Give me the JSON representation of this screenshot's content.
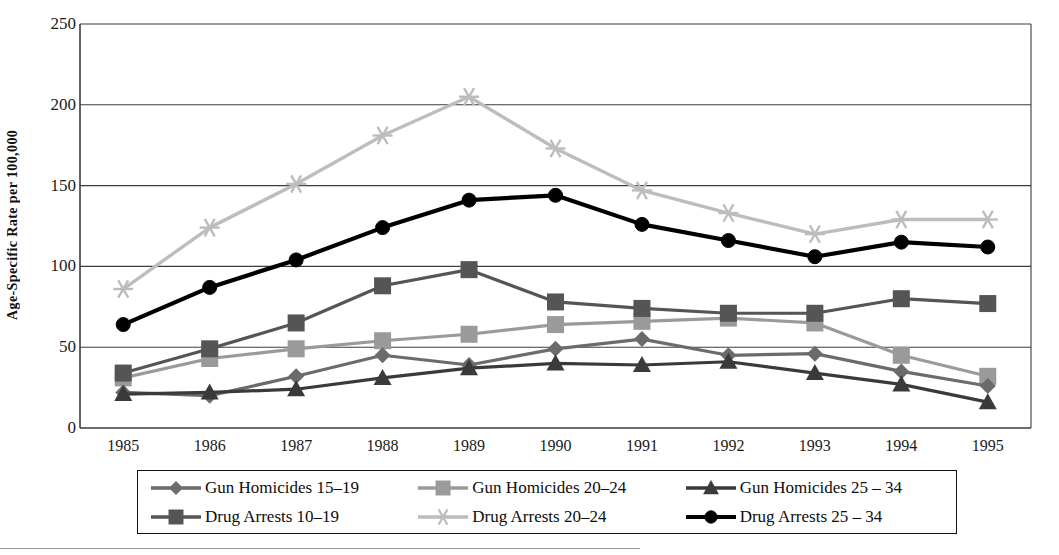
{
  "chart_data": {
    "type": "line",
    "title": "",
    "xlabel": "",
    "ylabel": "Age-Specific Rate per 100,000",
    "x": [
      "1985",
      "1986",
      "1987",
      "1988",
      "1989",
      "1990",
      "1991",
      "1992",
      "1993",
      "1994",
      "1995"
    ],
    "categories": [
      "1985",
      "1986",
      "1987",
      "1988",
      "1989",
      "1990",
      "1991",
      "1992",
      "1993",
      "1994",
      "1995"
    ],
    "ylim": [
      0,
      250
    ],
    "yticks": [
      0,
      50,
      100,
      150,
      200,
      250
    ],
    "ytick_labels": [
      "0",
      "50",
      "100",
      "150",
      "200",
      "250"
    ],
    "grid": "horizontal",
    "legend_position": "below",
    "series": [
      {
        "name": "Gun Homicides 15–19",
        "marker": "diamond",
        "color": "#6b6b6b",
        "values": [
          22,
          20,
          32,
          45,
          39,
          49,
          55,
          45,
          46,
          35,
          26
        ]
      },
      {
        "name": "Gun Homicides 20–24",
        "marker": "square",
        "color": "#9a9a9a",
        "values": [
          31,
          43,
          49,
          54,
          58,
          64,
          66,
          68,
          65,
          45,
          32
        ]
      },
      {
        "name": "Gun Homicides 25 – 34",
        "marker": "triangle",
        "color": "#3a3a3a",
        "values": [
          21,
          22,
          24,
          31,
          37,
          40,
          39,
          41,
          34,
          27,
          16
        ]
      },
      {
        "name": "Drug Arrests 10–19",
        "marker": "square",
        "color": "#555555",
        "values": [
          34,
          49,
          65,
          88,
          98,
          78,
          74,
          71,
          71,
          80,
          77
        ]
      },
      {
        "name": "Drug Arrests 20–24",
        "marker": "star",
        "color": "#bdbdbd",
        "values": [
          86,
          124,
          151,
          181,
          205,
          173,
          147,
          133,
          120,
          129,
          129
        ]
      },
      {
        "name": "Drug Arrests 25 – 34",
        "marker": "circle",
        "color": "#000000",
        "values": [
          64,
          87,
          104,
          124,
          141,
          144,
          126,
          116,
          106,
          115,
          112
        ]
      }
    ]
  },
  "legend": {
    "items": [
      {
        "label": "Gun Homicides 15–19",
        "marker": "diamond",
        "color": "#6b6b6b"
      },
      {
        "label": "Gun Homicides 20–24",
        "marker": "square",
        "color": "#9a9a9a"
      },
      {
        "label": "Gun Homicides 25 – 34",
        "marker": "triangle",
        "color": "#3a3a3a"
      },
      {
        "label": "Drug Arrests 10–19",
        "marker": "square",
        "color": "#555555"
      },
      {
        "label": "Drug Arrests 20–24",
        "marker": "star",
        "color": "#bdbdbd"
      },
      {
        "label": "Drug Arrests 25 – 34",
        "marker": "circle",
        "color": "#000000"
      }
    ]
  },
  "axis": {
    "y_title": "Age-Specific Rate per 100,000",
    "y_labels": [
      "250",
      "200",
      "150",
      "100",
      "50",
      "0"
    ],
    "x_labels": [
      "1985",
      "1986",
      "1987",
      "1988",
      "1989",
      "1990",
      "1991",
      "1992",
      "1993",
      "1994",
      "1995"
    ]
  }
}
